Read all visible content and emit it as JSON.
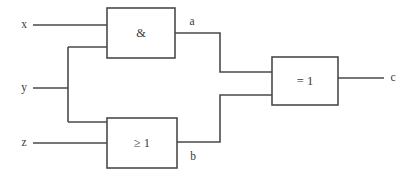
{
  "diagram": {
    "type": "logic-gate-schematic",
    "background_color": "#ffffff",
    "line_color": "#4a4a4a",
    "text_color": "#3a3a3a",
    "inputs": [
      {
        "name": "x",
        "label": "x"
      },
      {
        "name": "y",
        "label": "y"
      },
      {
        "name": "z",
        "label": "z"
      }
    ],
    "outputs": [
      {
        "name": "c",
        "label": "c"
      }
    ],
    "intermediate_signals": [
      {
        "name": "a",
        "label": "a"
      },
      {
        "name": "b",
        "label": "b"
      }
    ],
    "gates": [
      {
        "name": "and-gate",
        "label": "&",
        "function": "AND",
        "inputs": [
          "x",
          "y"
        ],
        "output": "a"
      },
      {
        "name": "or-gate",
        "label": "≥ 1",
        "function": "OR",
        "inputs": [
          "y",
          "z"
        ],
        "output": "b"
      },
      {
        "name": "xor-gate",
        "label": "= 1",
        "function": "XOR",
        "inputs": [
          "a",
          "b"
        ],
        "output": "c"
      }
    ]
  }
}
